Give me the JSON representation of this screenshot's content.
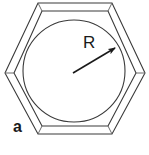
{
  "figure": {
    "caption_label": "a",
    "radius_label": "R",
    "colors": {
      "stroke": "#3a3a3a",
      "stroke_light": "#6b6b6b",
      "background": "#ffffff",
      "text": "#1a1a1a"
    },
    "geometry": {
      "outer_hexagon": {
        "points": "38,3 112,3 145,73 112,134 38,134 5,73",
        "stroke_width": 1.1
      },
      "inner_hexagon": {
        "points": "42,11 108,11 136,73 108,126 42,126 14,73",
        "stroke_width": 1.1
      },
      "bevel_edges": [
        {
          "x1": 38,
          "y1": 3,
          "x2": 42,
          "y2": 11
        },
        {
          "x1": 112,
          "y1": 3,
          "x2": 108,
          "y2": 11
        },
        {
          "x1": 145,
          "y1": 73,
          "x2": 136,
          "y2": 73
        },
        {
          "x1": 112,
          "y1": 134,
          "x2": 108,
          "y2": 126
        },
        {
          "x1": 38,
          "y1": 134,
          "x2": 42,
          "y2": 126
        },
        {
          "x1": 5,
          "y1": 73,
          "x2": 14,
          "y2": 73
        }
      ],
      "circle": {
        "cx": 74,
        "cy": 71,
        "r": 51,
        "stroke_width": 1.1
      },
      "radius_arrow": {
        "x1": 73,
        "y1": 73,
        "x2": 115,
        "y2": 48,
        "stroke_width": 1.6,
        "head_size": 7
      }
    }
  }
}
